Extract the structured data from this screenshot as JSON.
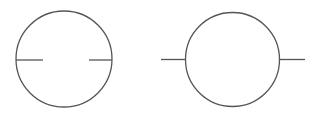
{
  "diagram": {
    "width": 319,
    "height": 119,
    "stroke_color": "#555555",
    "background_color": "#ffffff",
    "symbols": [
      {
        "id": "symbol-left",
        "type": "circle-with-internal-leads",
        "circle": {
          "cx": 64,
          "cy": 59,
          "r": 48
        },
        "leads": [
          {
            "x1": 16,
            "y1": 60,
            "x2": 43,
            "y2": 60
          },
          {
            "x1": 89,
            "y1": 60,
            "x2": 112,
            "y2": 60
          }
        ]
      },
      {
        "id": "symbol-right",
        "type": "circle-with-external-leads",
        "circle": {
          "cx": 232.5,
          "cy": 59.5,
          "r": 47
        },
        "leads": [
          {
            "x1": 161,
            "y1": 59.5,
            "x2": 185.5,
            "y2": 59.5
          },
          {
            "x1": 279.5,
            "y1": 59.5,
            "x2": 305,
            "y2": 59.5
          }
        ]
      }
    ]
  }
}
